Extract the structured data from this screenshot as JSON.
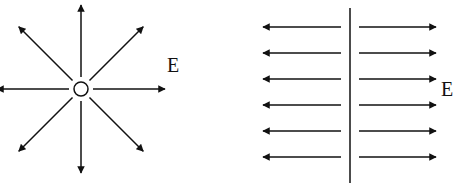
{
  "diagrams": [
    {
      "name": "point-charge-field",
      "label": "E",
      "description": "Radial electric field lines from a point charge",
      "directions_deg": [
        0,
        45,
        90,
        135,
        180,
        225,
        270,
        315
      ]
    },
    {
      "name": "charged-plane-field",
      "label": "E",
      "description": "Uniform electric field lines on both sides of a charged plane",
      "rows": 6
    }
  ],
  "colors": {
    "ink": "#111111",
    "background": "#ffffff"
  }
}
